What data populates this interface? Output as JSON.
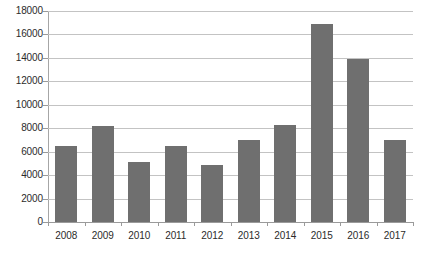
{
  "chart_data": {
    "type": "bar",
    "title": "",
    "subtitle": "",
    "xlabel": "",
    "ylabel": "",
    "categories": [
      "2008",
      "2009",
      "2010",
      "2011",
      "2012",
      "2013",
      "2014",
      "2015",
      "2016",
      "2017"
    ],
    "values": [
      6500,
      8200,
      5100,
      6500,
      4900,
      7000,
      8300,
      16900,
      13900,
      7000
    ],
    "series": [
      {
        "name": "",
        "values": [
          6500,
          8200,
          5100,
          6500,
          4900,
          7000,
          8300,
          16900,
          13900,
          7000
        ]
      }
    ],
    "ylim": [
      0,
      18000
    ],
    "ytick_labels": [
      "0",
      "2000",
      "4000",
      "6000",
      "8000",
      "10000",
      "12000",
      "14000",
      "16000",
      "18000"
    ],
    "ytick_values": [
      0,
      2000,
      4000,
      6000,
      8000,
      10000,
      12000,
      14000,
      16000,
      18000
    ],
    "grid": true,
    "grid_axis": "y",
    "legend": false,
    "legend_position": "none",
    "annotations": [],
    "bar_color": "#6f6f6f",
    "gridline_color": "#c3c3c3",
    "axis_color": "#9a9a9a",
    "background_color": "#ffffff",
    "text_color": "#2b2b2b"
  }
}
